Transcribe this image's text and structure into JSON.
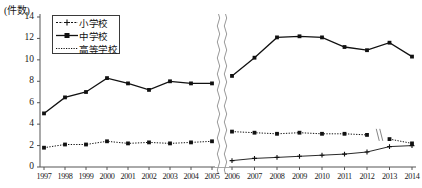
{
  "chart_data": {
    "type": "line",
    "title": "",
    "ylabel": "(件数)",
    "xlabel": "",
    "ylim": [
      0,
      14
    ],
    "ytick_values": [
      0,
      2,
      4,
      6,
      8,
      10,
      12,
      14
    ],
    "ytick_labels": [
      "0",
      "2",
      "4",
      "6",
      "8",
      "10",
      "12",
      "14"
    ],
    "grid": false,
    "legend_position": "upper-left-inside",
    "axis_breaks": [
      {
        "type": "vertical-wavy",
        "between": [
          "2005",
          "2006"
        ],
        "note": "full-height break in plot area"
      },
      {
        "type": "small-slash",
        "between": [
          "2012",
          "2013"
        ],
        "note": "break on 高等学校 dotted series"
      }
    ],
    "categories": [
      "1997",
      "1998",
      "1999",
      "2000",
      "2001",
      "2002",
      "2003",
      "2004",
      "2005",
      "2006",
      "2007",
      "2008",
      "2009",
      "2010",
      "2011",
      "2012",
      "2013",
      "2014"
    ],
    "series": [
      {
        "name": "小学校",
        "marker": "plus-cross",
        "linestyle": "solid-thin",
        "values": [
          null,
          null,
          null,
          null,
          null,
          null,
          null,
          null,
          null,
          0.6,
          0.8,
          0.9,
          1.0,
          1.1,
          1.2,
          1.4,
          1.9,
          2.0
        ]
      },
      {
        "name": "中学校",
        "marker": "filled-square",
        "linestyle": "solid",
        "values": [
          5.0,
          6.5,
          7.0,
          8.3,
          7.8,
          7.2,
          8.0,
          7.8,
          7.8,
          8.5,
          10.2,
          12.1,
          12.2,
          12.1,
          11.2,
          10.9,
          11.6,
          10.3
        ]
      },
      {
        "name": "高等学校",
        "marker": "filled-square",
        "linestyle": "dotted",
        "values": [
          1.8,
          2.1,
          2.1,
          2.4,
          2.2,
          2.3,
          2.2,
          2.3,
          2.4,
          3.3,
          3.2,
          3.1,
          3.2,
          3.1,
          3.1,
          3.0,
          2.6,
          2.2
        ]
      }
    ]
  },
  "axis": {
    "unit_label": "(件数)"
  },
  "legend": {
    "items": [
      {
        "label": "小学校",
        "style": "dash-cross-dash"
      },
      {
        "label": "中学校",
        "style": "solid-square"
      },
      {
        "label": "高等学校",
        "style": "dotted"
      }
    ]
  }
}
